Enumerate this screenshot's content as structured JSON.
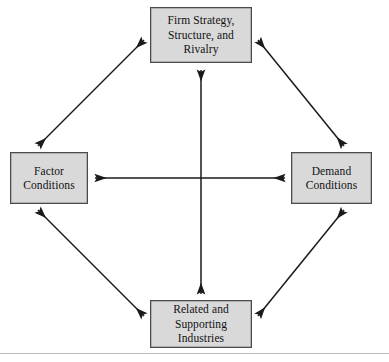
{
  "diagram": {
    "background_color": "#ffffff",
    "node_fill_color": "#d9d9d9",
    "node_border_color": "#4a4a4a",
    "arrow_color": "#1a1a1a",
    "nodes": [
      {
        "id": "firm-strategy",
        "label": "Firm Strategy, Structure, and Rivalry",
        "lines": [
          "Firm Strategy,",
          "Structure, and",
          "Rivalry"
        ],
        "position": "top"
      },
      {
        "id": "factor-conditions",
        "label": "Factor Conditions",
        "lines": [
          "Factor",
          "Conditions"
        ],
        "position": "left"
      },
      {
        "id": "demand-conditions",
        "label": "Demand Conditions",
        "lines": [
          "Demand",
          "Conditions"
        ],
        "position": "right"
      },
      {
        "id": "related-supporting",
        "label": "Related and Supporting Industries",
        "lines": [
          "Related and",
          "Supporting",
          "Industries"
        ],
        "position": "bottom"
      }
    ],
    "connectors": [
      {
        "id": "left-top",
        "from": "factor-conditions",
        "to": "firm-strategy",
        "style": "double-headed-arrow"
      },
      {
        "id": "top-right",
        "from": "firm-strategy",
        "to": "demand-conditions",
        "style": "double-headed-arrow"
      },
      {
        "id": "left-bottom",
        "from": "factor-conditions",
        "to": "related-supporting",
        "style": "double-headed-arrow"
      },
      {
        "id": "bottom-right",
        "from": "related-supporting",
        "to": "demand-conditions",
        "style": "double-headed-arrow"
      },
      {
        "id": "horizontal-center",
        "from": "factor-conditions",
        "to": "demand-conditions",
        "style": "double-headed-arrow"
      },
      {
        "id": "vertical-center",
        "from": "firm-strategy",
        "to": "related-supporting",
        "style": "double-headed-arrow"
      }
    ]
  }
}
